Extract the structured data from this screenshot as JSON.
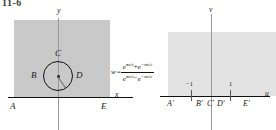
{
  "figure": {
    "number": "11-6",
    "type": "conformal-mapping-diagram",
    "mapping_formula_plain": "w = (e^(pi z / c) + e^(-pi z / c)) / (e^(pi z / c) - e^(-pi z / c))"
  },
  "formula": {
    "lhs": "w",
    "equals": "=",
    "numerator": {
      "term1_base": "e",
      "term1_exp": "πz/c",
      "operator": "+",
      "term2_base": "e",
      "term2_exp": "−πz/c"
    },
    "denominator": {
      "term1_base": "e",
      "term1_exp": "πz/c",
      "operator": "−",
      "term2_base": "e",
      "term2_exp": "−πz/c"
    }
  },
  "z_plane": {
    "axis_x_label": "x",
    "axis_y_label": "y",
    "points": [
      {
        "id": "A",
        "label": "A"
      },
      {
        "id": "B",
        "label": "B"
      },
      {
        "id": "C",
        "label": "C"
      },
      {
        "id": "D",
        "label": "D"
      },
      {
        "id": "E",
        "label": "E"
      }
    ],
    "region_fill": "#c9c9c9",
    "circle": {
      "cx": 58,
      "cy": 76,
      "r": 15,
      "stroke": "#111111"
    }
  },
  "w_plane": {
    "axis_u_label": "u",
    "axis_v_label": "v",
    "points": [
      {
        "id": "A1",
        "label": "A′"
      },
      {
        "id": "B1",
        "label": "B′"
      },
      {
        "id": "C1",
        "label": "C′"
      },
      {
        "id": "D1",
        "label": "D′"
      },
      {
        "id": "E1",
        "label": "E′"
      }
    ],
    "ticks": [
      {
        "value": "−1",
        "label": "−1"
      },
      {
        "value": "1",
        "label": "1"
      }
    ],
    "region_fill": "#e3e3e3"
  },
  "colors": {
    "axis_dark": "#111111",
    "axis_light": "#9a9a9a",
    "shade_left": "#c9c9c9",
    "shade_right": "#e3e3e3",
    "text": "#1a1a1a"
  }
}
